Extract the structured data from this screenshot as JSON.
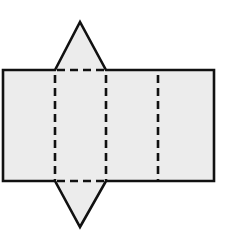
{
  "figure": {
    "description": "Net of a triangular prism: a rectangle divided into three rectangular faces by dashed fold lines, with a triangular face attached above and below the leftmost-middle face",
    "fill_color": "#ececec",
    "stroke_color": "#111111",
    "faces": [
      {
        "name": "rect-face-left",
        "type": "rectangle"
      },
      {
        "name": "rect-face-middle",
        "type": "rectangle"
      },
      {
        "name": "rect-face-right",
        "type": "rectangle"
      },
      {
        "name": "triangle-face-top",
        "type": "triangle"
      },
      {
        "name": "triangle-face-bottom",
        "type": "triangle"
      }
    ],
    "fold_lines": 5
  }
}
